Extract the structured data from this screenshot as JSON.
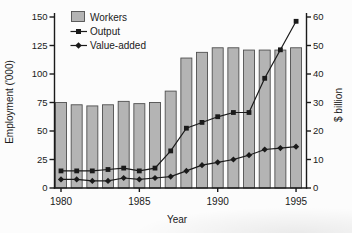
{
  "chart_data": {
    "type": "combo",
    "x": [
      1980,
      1981,
      1982,
      1983,
      1984,
      1985,
      1986,
      1987,
      1988,
      1989,
      1990,
      1991,
      1992,
      1993,
      1994,
      1995
    ],
    "series": [
      {
        "name": "Workers",
        "type": "bar",
        "axis": "left",
        "values": [
          75,
          73,
          72,
          73,
          76,
          74,
          75,
          85,
          114,
          119,
          123,
          123,
          121,
          121,
          121,
          123
        ]
      },
      {
        "name": "Output",
        "type": "line",
        "marker": "square",
        "axis": "right",
        "values": [
          6,
          6,
          6,
          6.5,
          7,
          6,
          7,
          13,
          21,
          23,
          25,
          26.5,
          26.5,
          38.5,
          48.5,
          58.5
        ]
      },
      {
        "name": "Value-added",
        "type": "line",
        "marker": "diamond",
        "axis": "right",
        "values": [
          3,
          3,
          2.5,
          2.5,
          3.5,
          3,
          3.5,
          4,
          6,
          8,
          9,
          10,
          11.5,
          13.5,
          14,
          14.5
        ]
      }
    ],
    "left_axis": {
      "label": "Employment ('000)",
      "min": 0,
      "max": 150,
      "ticks": [
        0,
        25,
        50,
        75,
        100,
        125,
        150
      ]
    },
    "right_axis": {
      "label": "$ billion",
      "min": 0,
      "max": 60,
      "ticks": [
        0,
        10,
        20,
        30,
        40,
        50,
        60
      ]
    },
    "x_axis": {
      "label": "Year",
      "tick_labels": [
        1980,
        1985,
        1990,
        1995
      ]
    },
    "legend": {
      "position": "top-left",
      "entries": [
        "Workers",
        "Output",
        "Value-added"
      ]
    },
    "colors": {
      "bar_fill": "#b4b4b4",
      "bar_stroke": "#4f4f4f",
      "line": "#1a1a1a",
      "text": "#1a1a1a",
      "background": "#fcfcfc"
    }
  }
}
